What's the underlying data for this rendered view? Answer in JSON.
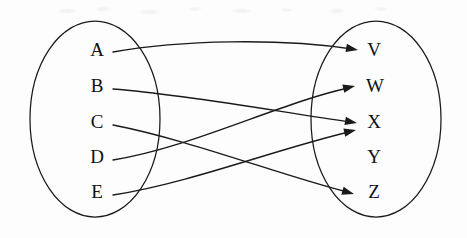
{
  "diagram": {
    "type": "function-mapping-diagram",
    "background_color": "#fdfdfd",
    "stroke_color": "#1a1a1a",
    "domain_set": {
      "name": "domain-set",
      "ellipse": {
        "cx": 95,
        "cy": 119,
        "rx": 65,
        "ry": 98
      },
      "elements": [
        {
          "label": "A",
          "x": 97,
          "y": 52
        },
        {
          "label": "B",
          "x": 97,
          "y": 88
        },
        {
          "label": "C",
          "x": 97,
          "y": 124
        },
        {
          "label": "D",
          "x": 97,
          "y": 159
        },
        {
          "label": "E",
          "x": 97,
          "y": 194
        }
      ]
    },
    "codomain_set": {
      "name": "codomain-set",
      "ellipse": {
        "cx": 376,
        "cy": 119,
        "rx": 65,
        "ry": 98
      },
      "elements": [
        {
          "label": "V",
          "x": 374,
          "y": 52
        },
        {
          "label": "W",
          "x": 375,
          "y": 88
        },
        {
          "label": "X",
          "x": 374,
          "y": 124
        },
        {
          "label": "Y",
          "x": 374,
          "y": 159
        },
        {
          "label": "Z",
          "x": 374,
          "y": 194
        }
      ]
    },
    "mappings": [
      {
        "from": "A",
        "to": "V",
        "path": "M 113 52 C 180 40, 280 38, 352 49",
        "head": {
          "x": 358,
          "y": 50,
          "angle": 10
        }
      },
      {
        "from": "B",
        "to": "X",
        "path": "M 113 89 C 190 95, 280 112, 350 122",
        "head": {
          "x": 357,
          "y": 123,
          "angle": 10
        }
      },
      {
        "from": "C",
        "to": "Z",
        "path": "M 113 125 C 190 140, 280 175, 347 192",
        "head": {
          "x": 354,
          "y": 194,
          "angle": 16
        }
      },
      {
        "from": "D",
        "to": "W",
        "path": "M 113 160 C 190 148, 280 103, 348 88",
        "head": {
          "x": 355,
          "y": 86,
          "angle": -13
        }
      },
      {
        "from": "E",
        "to": "X",
        "path": "M 113 195 C 190 183, 280 148, 349 132",
        "head": {
          "x": 356,
          "y": 130,
          "angle": -13
        }
      }
    ],
    "unmapped_codomain_elements": [
      "Y"
    ],
    "multi_target_elements": [
      "X"
    ]
  }
}
